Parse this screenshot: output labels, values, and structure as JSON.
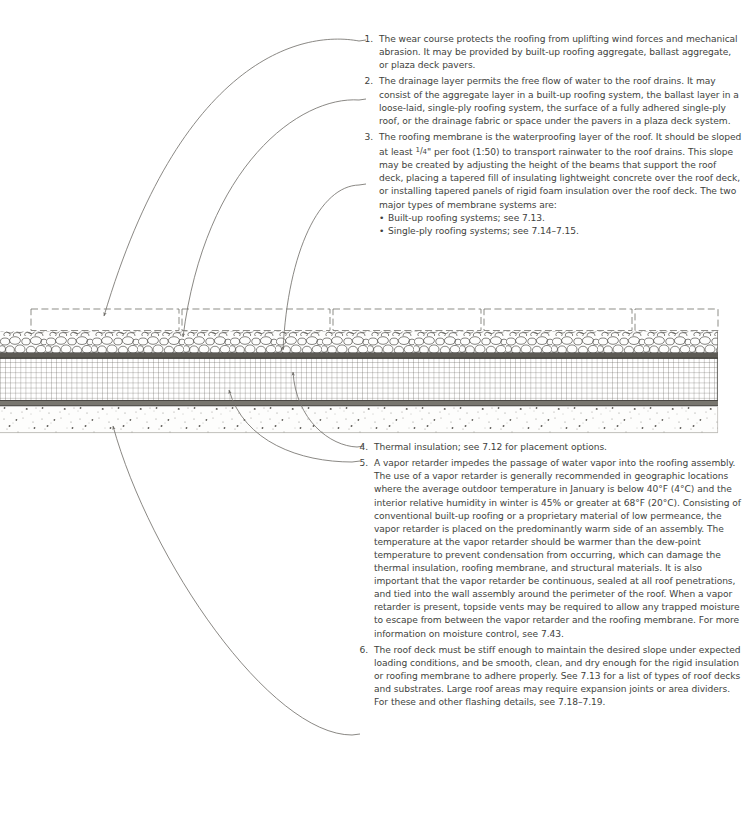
{
  "page": {
    "background": "#ffffff",
    "text_color": "#413f3d"
  },
  "diagram": {
    "name": "roof-assembly-section",
    "caption": "",
    "layers": [
      {
        "id": 1,
        "name": "wear-course-pavers",
        "style": "dashed-outline-rectangles",
        "label": "Wear course / plaza deck pavers",
        "y_top": 308,
        "y_bottom": 331,
        "fill": "#ffffff",
        "stroke": "#6a6a66"
      },
      {
        "id": 2,
        "name": "drainage-aggregate-layer",
        "style": "rounded-aggregate-stones",
        "label": "Drainage layer (aggregate / ballast)",
        "y_top": 331,
        "y_bottom": 352,
        "fill": "#fdfdfd",
        "stroke": "#55534f"
      },
      {
        "id": 3,
        "name": "roofing-membrane",
        "style": "solid-dark-band",
        "label": "Roofing membrane",
        "y_top": 352,
        "y_bottom": 358,
        "fill": "#4a4843",
        "stroke": "#2e2c28"
      },
      {
        "id": 4,
        "name": "thermal-insulation",
        "style": "fine-grid-hatch",
        "label": "Thermal insulation",
        "y_top": 358,
        "y_bottom": 400,
        "fill": "#ffffff",
        "stroke": "#56544f"
      },
      {
        "id": 5,
        "name": "vapor-retarder",
        "style": "thin-double-line",
        "label": "Vapor retarder",
        "y_top": 400,
        "y_bottom": 407,
        "fill": "#6b6963",
        "stroke": "#3a3834"
      },
      {
        "id": 6,
        "name": "roof-deck-concrete",
        "style": "stippled-concrete",
        "label": "Roof deck (structural)",
        "y_top": 407,
        "y_bottom": 432,
        "fill": "#fcfcfb",
        "stroke": "#8c8a85"
      }
    ],
    "extent": {
      "x_left": 0,
      "x_right": 718,
      "y_top": 308,
      "y_bottom": 432
    },
    "leader_lines": [
      {
        "target_layer": 1,
        "note": 1,
        "arrow_at": [
          104,
          322
        ]
      },
      {
        "target_layer": 2,
        "note": 2,
        "arrow_at": [
          183,
          341
        ]
      },
      {
        "target_layer": 3,
        "note": 3,
        "arrow_at": [
          283,
          353
        ]
      },
      {
        "target_layer": 4,
        "note": 4,
        "arrow_at": [
          293,
          371
        ]
      },
      {
        "target_layer": 5,
        "note": 5,
        "arrow_at": [
          229,
          387
        ]
      },
      {
        "target_layer": 6,
        "note": 6,
        "arrow_at": [
          113,
          424
        ]
      }
    ]
  },
  "notes": {
    "top": [
      {
        "number": "1.",
        "text": "The wear course protects the roofing from uplifting wind forces and mechanical abrasion. It may be provided by built-up roofing aggregate, ballast aggregate, or plaza deck pavers."
      },
      {
        "number": "2.",
        "text": "The drainage layer permits the free flow of water to the roof drains. It may consist of the aggregate layer in a built-up roofing system, the ballast layer in a loose-laid, single-ply roofing system, the surface of a fully adhered single-ply roof, or the drainage fabric or space under the pavers in a plaza deck system."
      },
      {
        "number": "3.",
        "text_before_fraction": "The roofing membrane is the waterproofing layer of the roof. It should be sloped at least ",
        "fraction_numerator": "1",
        "fraction_denominator": "4",
        "text_after_fraction": "\" per foot (1:50) to transport rainwater to the roof drains. This slope may be created by adjusting the height of the beams that support the roof deck, placing a tapered fill of insulating lightweight concrete over the roof deck, or installing tapered panels of rigid foam insulation over the roof deck. The two major types of membrane systems are:",
        "bullets": [
          {
            "marker": "•",
            "text": "Built-up roofing systems; see 7.13."
          },
          {
            "marker": "•",
            "text": "Single-ply roofing systems; see 7.14–7.15."
          }
        ]
      }
    ],
    "bottom": [
      {
        "number": "4.",
        "text": "Thermal insulation; see 7.12 for placement options."
      },
      {
        "number": "5.",
        "text": "A vapor retarder impedes the passage of water vapor into the roofing assembly. The use of a vapor retarder is generally recommended in geographic locations where the average outdoor temperature in January is below 40°F (4°C) and the interior relative humidity in winter is 45% or greater at 68°F (20°C). Consisting of conventional built-up roofing or a proprietary material of low permeance, the vapor retarder is placed on the predominantly warm side of an assembly. The temperature at the vapor retarder should be warmer than the dew-point temperature to prevent condensation from occurring, which can damage the thermal insulation, roofing membrane, and structural materials. It is also important that the vapor retarder be continuous, sealed at all roof penetrations, and tied into the wall assembly around the perimeter of the roof. When a vapor retarder is present, topside vents may be required to allow any trapped moisture to escape from between the vapor retarder and the roofing membrane. For more information on moisture control, see 7.43."
      },
      {
        "number": "6.",
        "text": "The roof deck must be stiff enough to maintain the desired slope under expected loading conditions, and be smooth, clean, and dry enough for the rigid insulation or roofing membrane to adhere properly. See 7.13 for a list of types of roof decks and substrates. Large roof areas may require expansion joints or area dividers. For these and other flashing details, see 7.18–7.19."
      }
    ]
  }
}
